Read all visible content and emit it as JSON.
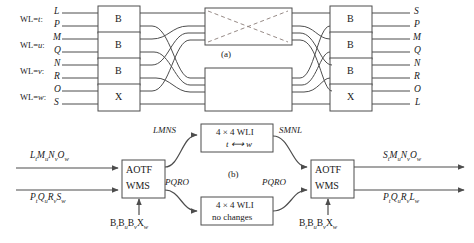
{
  "figure": {
    "panel_a_label": "(a)",
    "panel_b_label": "(b)",
    "line_color": "#4d4d4d",
    "dashed_color": "#8a7d78",
    "background": "#ffffff"
  },
  "panel_a": {
    "wavelength_labels": [
      {
        "prefix": "WL=",
        "value": "t",
        "suffix": ":"
      },
      {
        "prefix": "WL=",
        "value": "u",
        "suffix": ":"
      },
      {
        "prefix": "WL=",
        "value": "v",
        "suffix": ":"
      },
      {
        "prefix": "WL=",
        "value": "w",
        "suffix": ":"
      }
    ],
    "input_ports": [
      "L",
      "P",
      "M",
      "Q",
      "N",
      "R",
      "O",
      "S"
    ],
    "output_ports": [
      "S",
      "P",
      "M",
      "Q",
      "N",
      "R",
      "O",
      "L"
    ],
    "left_boxes": [
      "B",
      "B",
      "B",
      "X"
    ],
    "right_boxes": [
      "B",
      "B",
      "B",
      "X"
    ],
    "center_top_box": "",
    "center_bottom_box": ""
  },
  "panel_b": {
    "inputs": [
      {
        "parts": [
          [
            "L",
            "t"
          ],
          [
            "M",
            "u"
          ],
          [
            "N",
            "v"
          ],
          [
            "O",
            "w"
          ]
        ]
      },
      {
        "parts": [
          [
            "P",
            "t"
          ],
          [
            "Q",
            "u"
          ],
          [
            "R",
            "v"
          ],
          [
            "S",
            "w"
          ]
        ]
      }
    ],
    "outputs": [
      {
        "parts": [
          [
            "S",
            "t"
          ],
          [
            "M",
            "u"
          ],
          [
            "N",
            "v"
          ],
          [
            "O",
            "w"
          ]
        ]
      },
      {
        "parts": [
          [
            "P",
            "t"
          ],
          [
            "Q",
            "u"
          ],
          [
            "R",
            "v"
          ],
          [
            "L",
            "w"
          ]
        ]
      }
    ],
    "left_switch": {
      "line1": "AOTF",
      "line2": "WMS"
    },
    "right_switch": {
      "line1": "AOTF",
      "line2": "WMS"
    },
    "left_control": {
      "parts": [
        [
          "B",
          "t"
        ],
        [
          "B",
          "u"
        ],
        [
          "B",
          "v"
        ],
        [
          "X",
          "w"
        ]
      ]
    },
    "right_control": {
      "parts": [
        [
          "B",
          "t"
        ],
        [
          "B",
          "u"
        ],
        [
          "B",
          "v"
        ],
        [
          "X",
          "w"
        ]
      ]
    },
    "wli_top": {
      "line1": "4 × 4 WLI",
      "line2": "t ⟷ w"
    },
    "wli_bottom": {
      "line1": "4 × 4 WLI",
      "line2": "no changes"
    },
    "signal_labels": {
      "top_left": "LMNS",
      "bottom_left": "PQRO",
      "top_right": "SMNL",
      "bottom_right": "PQRO"
    }
  }
}
